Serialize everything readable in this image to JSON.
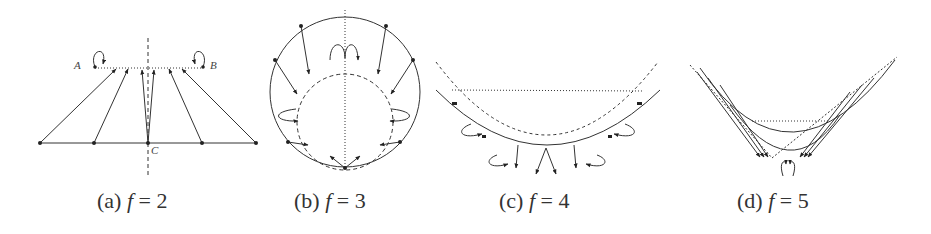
{
  "figure": {
    "panels": [
      {
        "id": "a",
        "caption_prefix": "(a)",
        "caption_var": "f",
        "caption_eq": "= 2",
        "labels": {
          "A": "A",
          "B": "B",
          "C": "C"
        }
      },
      {
        "id": "b",
        "caption_prefix": "(b)",
        "caption_var": "f",
        "caption_eq": "= 3"
      },
      {
        "id": "c",
        "caption_prefix": "(c)",
        "caption_var": "f",
        "caption_eq": "= 4"
      },
      {
        "id": "d",
        "caption_prefix": "(d)",
        "caption_var": "f",
        "caption_eq": "= 5"
      }
    ],
    "colors": {
      "ink": "#333333",
      "background": "#ffffff"
    }
  }
}
